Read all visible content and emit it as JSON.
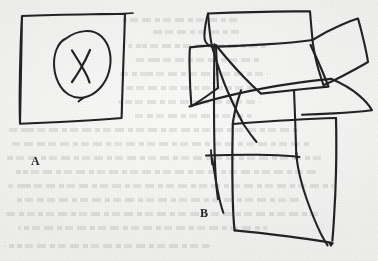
{
  "document": {
    "kind": "scanned-handdrawn-figure",
    "background_color": "#f3f3f1",
    "ink_color": "#232326",
    "width": 378,
    "height": 261
  },
  "figures": [
    {
      "id": "A",
      "label": "A",
      "label_x": 31,
      "label_y": 155,
      "description": "hand-drawn quadrilateral frame enclosing a hand-drawn circle with an X inside",
      "parts": [
        {
          "name": "outer-rectangle",
          "shape": "quadrilateral"
        },
        {
          "name": "inner-circle",
          "shape": "ellipse"
        },
        {
          "name": "x-mark",
          "shape": "cross"
        }
      ]
    },
    {
      "id": "B",
      "label": "B",
      "label_x": 200,
      "label_y": 207,
      "description": "cluster of overlapping hand-drawn quadrilaterals forming an unfolded box-like sketch",
      "parts": [
        {
          "name": "top-panel",
          "shape": "quadrilateral"
        },
        {
          "name": "upper-right-panel",
          "shape": "quadrilateral"
        },
        {
          "name": "left-panel",
          "shape": "quadrilateral"
        },
        {
          "name": "center-panel",
          "shape": "quadrilateral"
        },
        {
          "name": "right-flap",
          "shape": "quadrilateral"
        },
        {
          "name": "lower-panel",
          "shape": "quadrilateral"
        },
        {
          "name": "stray-stroke-horizontal",
          "shape": "line"
        },
        {
          "name": "stray-stroke-diagonal",
          "shape": "line"
        }
      ]
    }
  ],
  "bleed_through_lines": [
    {
      "x": 122,
      "y": 18,
      "w": 118
    },
    {
      "x": 150,
      "y": 30,
      "w": 90
    },
    {
      "x": 128,
      "y": 44,
      "w": 138
    },
    {
      "x": 134,
      "y": 58,
      "w": 126
    },
    {
      "x": 120,
      "y": 72,
      "w": 148
    },
    {
      "x": 126,
      "y": 86,
      "w": 134
    },
    {
      "x": 118,
      "y": 100,
      "w": 142
    },
    {
      "x": 132,
      "y": 114,
      "w": 120
    },
    {
      "x": 6,
      "y": 128,
      "w": 292
    },
    {
      "x": 10,
      "y": 142,
      "w": 300
    },
    {
      "x": 4,
      "y": 156,
      "w": 318
    },
    {
      "x": 12,
      "y": 170,
      "w": 304
    },
    {
      "x": 8,
      "y": 184,
      "w": 326
    },
    {
      "x": 14,
      "y": 198,
      "w": 286
    },
    {
      "x": 6,
      "y": 212,
      "w": 316
    },
    {
      "x": 18,
      "y": 226,
      "w": 250
    },
    {
      "x": 4,
      "y": 244,
      "w": 206
    }
  ]
}
